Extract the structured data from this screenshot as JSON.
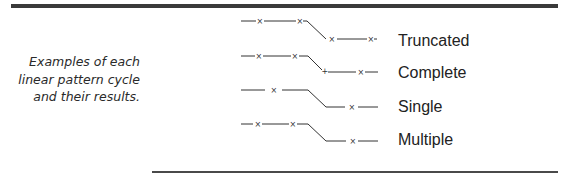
{
  "caption": {
    "lines": [
      "Examples of each",
      "linear pattern cycle",
      "and their results."
    ]
  },
  "patterns": [
    {
      "label": "Truncated",
      "marker_symbol": "×",
      "join_symbol": ""
    },
    {
      "label": "Complete",
      "marker_symbol": "×",
      "join_symbol": "+"
    },
    {
      "label": "Single",
      "marker_symbol": "×",
      "join_symbol": ""
    },
    {
      "label": "Multiple",
      "marker_symbol": "×",
      "join_symbol": ""
    }
  ],
  "colors": {
    "rule": "#3a3a3a",
    "stroke": "#333333",
    "text": "#222222"
  }
}
